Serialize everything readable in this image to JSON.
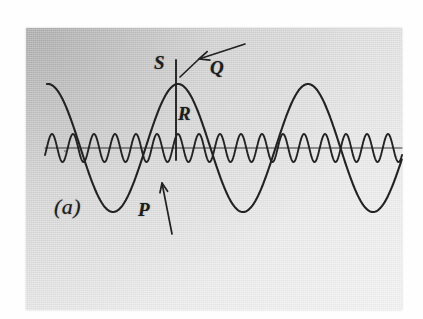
{
  "figure": {
    "caption_label": "(a)",
    "kind": "superimposed-sine-waves",
    "background_color": "#dcdcdc",
    "ink_color": "#222222",
    "plate": {
      "x": 26,
      "y": 28,
      "width": 376,
      "height": 282
    }
  },
  "labels": [
    {
      "id": "S",
      "text": "S",
      "x": 154,
      "y": 53,
      "describes": "peak of modulating wave at marker line"
    },
    {
      "id": "Q",
      "text": "Q",
      "x": 210,
      "y": 58,
      "describes": "arrow pointing to envelope crest"
    },
    {
      "id": "R",
      "text": "R",
      "x": 178,
      "y": 104,
      "describes": "vertical marker line below S"
    },
    {
      "id": "P",
      "text": "P",
      "x": 138,
      "y": 200,
      "describes": "arrow pointing to rising flank of wave"
    },
    {
      "id": "a",
      "text": "(a)",
      "x": 54,
      "y": 196,
      "describes": "figure part label"
    }
  ],
  "arrows": [
    {
      "id": "Q-arrow",
      "from": {
        "x": 245,
        "y": 44
      },
      "to": {
        "x": 199,
        "y": 59
      },
      "tail_to": {
        "x": 180,
        "y": 77
      }
    },
    {
      "id": "P-arrow",
      "from": {
        "x": 172,
        "y": 234
      },
      "to": {
        "x": 162,
        "y": 183
      }
    }
  ],
  "marker_line": {
    "id": "S-R-marker",
    "x": 176,
    "y_top": 60,
    "y_bottom": 160
  },
  "chart_data": {
    "type": "line",
    "title": "",
    "xlabel": "",
    "ylabel": "",
    "xlim": [
      28,
      402
    ],
    "ylim": [
      70,
      230
    ],
    "baseline_y": 148,
    "grid": false,
    "legend": null,
    "annotations": [
      "S",
      "Q",
      "R",
      "P",
      "(a)"
    ],
    "series": [
      {
        "name": "low-frequency wave",
        "waveform": "cosine",
        "amplitude": 64,
        "wavelength": 130,
        "phase_peak_x": 178,
        "x_start": 47,
        "x_end": 402,
        "peaks_x": [
          178,
          308
        ],
        "troughs_x": [
          113,
          243,
          373
        ],
        "stroke_width": 2.1
      },
      {
        "name": "high-frequency wave",
        "waveform": "cosine",
        "amplitude": 14,
        "wavelength": 21,
        "phase_peak_x": 178,
        "x_start": 45,
        "x_end": 402,
        "cycle_count": 17,
        "stroke_width": 1.9
      }
    ],
    "axis_line": {
      "y": 148,
      "x_start": 45,
      "x_end": 402,
      "stroke_width": 1.2
    }
  }
}
